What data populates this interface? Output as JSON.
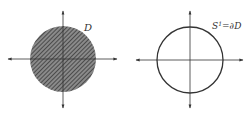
{
  "figures": [
    {
      "id": "disk",
      "label": "D",
      "fill": "hatched",
      "center": [
        63,
        59
      ],
      "radius": 33
    },
    {
      "id": "circle",
      "label_main": "S",
      "label_sup": "1",
      "label_rest": "=∂D",
      "fill": "none",
      "center": [
        190,
        60
      ],
      "radius": 33
    }
  ],
  "colors": {
    "stroke": "#333333",
    "hatch": "#444444",
    "background": "#ffffff"
  }
}
